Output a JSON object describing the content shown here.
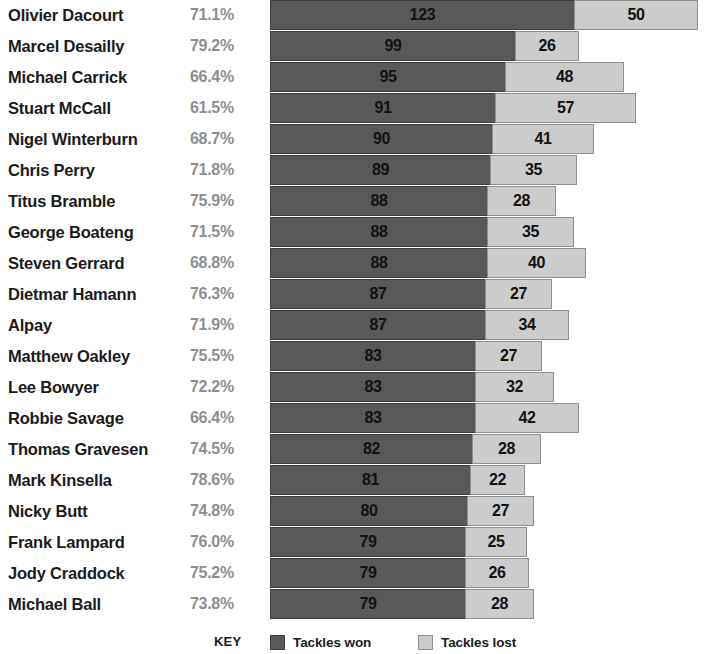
{
  "chart_data": {
    "type": "bar",
    "title": "",
    "subtitle": "",
    "xlabel": "",
    "ylabel": "",
    "orientation": "horizontal",
    "stacked": true,
    "grid": false,
    "legend_position": "bottom",
    "axis_visible": false,
    "xlim": [
      0,
      180
    ],
    "categories": [
      "Olivier Dacourt",
      "Marcel Desailly",
      "Michael Carrick",
      "Stuart McCall",
      "Nigel Winterburn",
      "Chris Perry",
      "Titus Bramble",
      "George Boateng",
      "Steven Gerrard",
      "Dietmar Hamann",
      "Alpay",
      "Matthew Oakley",
      "Lee Bowyer",
      "Robbie Savage",
      "Thomas Gravesen",
      "Mark Kinsella",
      "Nicky Butt",
      "Frank Lampard",
      "Jody Craddock",
      "Michael Ball"
    ],
    "series": [
      {
        "name": "Tackles won",
        "color": "#595959",
        "values": [
          123,
          99,
          95,
          91,
          90,
          89,
          88,
          88,
          88,
          87,
          87,
          83,
          83,
          83,
          82,
          81,
          80,
          79,
          79,
          79
        ]
      },
      {
        "name": "Tackles lost",
        "color": "#cccccc",
        "values": [
          50,
          26,
          48,
          57,
          41,
          35,
          28,
          35,
          40,
          27,
          34,
          27,
          32,
          42,
          28,
          22,
          27,
          25,
          26,
          28
        ]
      }
    ],
    "percent_labels": [
      "71.1%",
      "79.2%",
      "66.4%",
      "61.5%",
      "68.7%",
      "71.8%",
      "75.9%",
      "71.5%",
      "68.8%",
      "76.3%",
      "71.9%",
      "75.5%",
      "72.2%",
      "66.4%",
      "74.5%",
      "78.6%",
      "74.8%",
      "76.0%",
      "75.2%",
      "73.8%"
    ]
  },
  "rows": [
    {
      "name": "Olivier Dacourt",
      "pct": "71.1%",
      "won": 123,
      "lost": 50
    },
    {
      "name": "Marcel Desailly",
      "pct": "79.2%",
      "won": 99,
      "lost": 26
    },
    {
      "name": "Michael Carrick",
      "pct": "66.4%",
      "won": 95,
      "lost": 48
    },
    {
      "name": "Stuart McCall",
      "pct": "61.5%",
      "won": 91,
      "lost": 57
    },
    {
      "name": "Nigel Winterburn",
      "pct": "68.7%",
      "won": 90,
      "lost": 41
    },
    {
      "name": "Chris Perry",
      "pct": "71.8%",
      "won": 89,
      "lost": 35
    },
    {
      "name": "Titus Bramble",
      "pct": "75.9%",
      "won": 88,
      "lost": 28
    },
    {
      "name": "George Boateng",
      "pct": "71.5%",
      "won": 88,
      "lost": 35
    },
    {
      "name": "Steven Gerrard",
      "pct": "68.8%",
      "won": 88,
      "lost": 40
    },
    {
      "name": "Dietmar Hamann",
      "pct": "76.3%",
      "won": 87,
      "lost": 27
    },
    {
      "name": "Alpay",
      "pct": "71.9%",
      "won": 87,
      "lost": 34
    },
    {
      "name": "Matthew Oakley",
      "pct": "75.5%",
      "won": 83,
      "lost": 27
    },
    {
      "name": "Lee Bowyer",
      "pct": "72.2%",
      "won": 83,
      "lost": 32
    },
    {
      "name": "Robbie Savage",
      "pct": "66.4%",
      "won": 83,
      "lost": 42
    },
    {
      "name": "Thomas Gravesen",
      "pct": "74.5%",
      "won": 82,
      "lost": 28
    },
    {
      "name": "Mark Kinsella",
      "pct": "78.6%",
      "won": 81,
      "lost": 22
    },
    {
      "name": "Nicky Butt",
      "pct": "74.8%",
      "won": 80,
      "lost": 27
    },
    {
      "name": "Frank Lampard",
      "pct": "76.0%",
      "won": 79,
      "lost": 25
    },
    {
      "name": "Jody Craddock",
      "pct": "75.2%",
      "won": 79,
      "lost": 26
    },
    {
      "name": "Michael Ball",
      "pct": "73.8%",
      "won": 79,
      "lost": 28
    }
  ],
  "legend": {
    "key_label": "KEY",
    "items": [
      {
        "label": "Tackles won",
        "color": "#595959"
      },
      {
        "label": "Tackles lost",
        "color": "#cccccc"
      }
    ]
  },
  "scale": {
    "px_per_unit": 2.48,
    "bar_origin_x": 270
  }
}
